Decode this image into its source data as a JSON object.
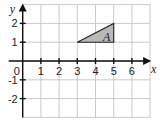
{
  "chart_data": {
    "type": "coordinate-grid",
    "x_range": [
      0,
      7
    ],
    "y_range": [
      -3,
      3
    ],
    "grid": true,
    "x_axis_label": "x",
    "y_axis_label": "y",
    "x_tick_labels": [
      "0",
      "1",
      "2",
      "3",
      "4",
      "5",
      "6"
    ],
    "y_tick_labels": [
      "2",
      "1",
      "-1",
      "-2"
    ],
    "shapes": [
      {
        "label": "A",
        "type": "triangle",
        "vertices": [
          [
            3,
            1
          ],
          [
            5,
            2
          ],
          [
            5,
            1
          ]
        ],
        "fill": "#b9b9b9",
        "stroke": "#222222"
      }
    ]
  },
  "layout": {
    "origin_px": [
      22.7,
      61
    ],
    "unit_x_px": 18.2,
    "unit_y_px": 18.8
  }
}
